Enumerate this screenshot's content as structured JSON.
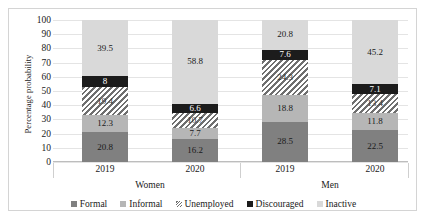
{
  "chart_data": {
    "type": "bar",
    "subtype": "stacked-bar-100",
    "title": "",
    "xlabel": "",
    "ylabel": "Percentage probability",
    "ylim": [
      0,
      100
    ],
    "ytick_step": 10,
    "yticks": [
      0,
      10,
      20,
      30,
      40,
      50,
      60,
      70,
      80,
      90,
      100
    ],
    "grid": true,
    "legend_position": "bottom",
    "groups": [
      {
        "name": "Women",
        "categories": [
          "2019",
          "2020"
        ]
      },
      {
        "name": "Men",
        "categories": [
          "2019",
          "2020"
        ]
      }
    ],
    "categories": [
      "2019",
      "2020",
      "2019",
      "2020"
    ],
    "series": [
      {
        "name": "Formal",
        "color": "#808080",
        "values": [
          20.8,
          16.2,
          28.5,
          22.5
        ]
      },
      {
        "name": "Informal",
        "color": "#b6b6b6",
        "values": [
          12.3,
          7.7,
          18.8,
          11.8
        ]
      },
      {
        "name": "Unemployed",
        "color": "#6f6f6f",
        "hatch": "diagonal",
        "values": [
          19.4,
          10.7,
          24.3,
          13.4
        ]
      },
      {
        "name": "Discouraged",
        "color": "#1c1c1c",
        "values": [
          8,
          6.6,
          7.6,
          7.1
        ]
      },
      {
        "name": "Inactive",
        "color": "#d9d9d9",
        "values": [
          39.5,
          58.8,
          20.8,
          45.2
        ]
      }
    ],
    "bars": [
      {
        "group": "Women",
        "year": "2019",
        "segments": [
          {
            "series": "Formal",
            "value": 20.8,
            "label": "20.8"
          },
          {
            "series": "Informal",
            "value": 12.3,
            "label": "12.3"
          },
          {
            "series": "Unemployed",
            "value": 19.4,
            "label": "19.4"
          },
          {
            "series": "Discouraged",
            "value": 8,
            "label": "8"
          },
          {
            "series": "Inactive",
            "value": 39.5,
            "label": "39.5"
          }
        ]
      },
      {
        "group": "Women",
        "year": "2020",
        "segments": [
          {
            "series": "Formal",
            "value": 16.2,
            "label": "16.2"
          },
          {
            "series": "Informal",
            "value": 7.7,
            "label": "7.7"
          },
          {
            "series": "Unemployed",
            "value": 10.7,
            "label": "10.7"
          },
          {
            "series": "Discouraged",
            "value": 6.6,
            "label": "6.6"
          },
          {
            "series": "Inactive",
            "value": 58.8,
            "label": "58.8"
          }
        ]
      },
      {
        "group": "Men",
        "year": "2019",
        "segments": [
          {
            "series": "Formal",
            "value": 28.5,
            "label": "28.5"
          },
          {
            "series": "Informal",
            "value": 18.8,
            "label": "18.8"
          },
          {
            "series": "Unemployed",
            "value": 24.3,
            "label": "24.3"
          },
          {
            "series": "Discouraged",
            "value": 7.6,
            "label": "7.6"
          },
          {
            "series": "Inactive",
            "value": 20.8,
            "label": "20.8"
          }
        ]
      },
      {
        "group": "Men",
        "year": "2020",
        "segments": [
          {
            "series": "Formal",
            "value": 22.5,
            "label": "22.5"
          },
          {
            "series": "Informal",
            "value": 11.8,
            "label": "11.8"
          },
          {
            "series": "Unemployed",
            "value": 13.4,
            "label": "13.4"
          },
          {
            "series": "Discouraged",
            "value": 7.1,
            "label": "7.1"
          },
          {
            "series": "Inactive",
            "value": 45.2,
            "label": "45.2"
          }
        ]
      }
    ],
    "legend": [
      {
        "label": "Formal",
        "key": "formal"
      },
      {
        "label": "Informal",
        "key": "informal"
      },
      {
        "label": "Unemployed",
        "key": "unemployed"
      },
      {
        "label": "Discouraged",
        "key": "discouraged"
      },
      {
        "label": "Inactive",
        "key": "inactive"
      }
    ]
  }
}
